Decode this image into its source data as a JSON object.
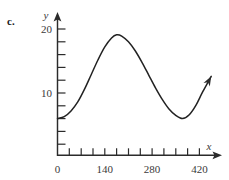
{
  "figure": {
    "part_label": "c.",
    "x_axis_name": "x",
    "y_axis_name": "y"
  },
  "chart_data": {
    "type": "line",
    "title": "",
    "subtitle": "",
    "xlabel": "x",
    "ylabel": "y",
    "xlim": [
      0,
      455
    ],
    "ylim": [
      0,
      21.5
    ],
    "grid": false,
    "legend": null,
    "x_tick_labels": [
      "0",
      "140",
      "280",
      "420"
    ],
    "x_tick_label_values": [
      0,
      140,
      280,
      420
    ],
    "x_minor_tick_values": [
      35,
      70,
      105,
      140,
      175,
      210,
      245,
      280,
      315,
      350,
      385,
      420
    ],
    "x_tick_interval": 35,
    "y_tick_labels": [
      "10",
      "20"
    ],
    "y_tick_label_values": [
      10,
      20
    ],
    "y_minor_tick_values": [
      2,
      4,
      6,
      8,
      10,
      12,
      14,
      16,
      18,
      20
    ],
    "y_tick_interval": 2,
    "series": [
      {
        "name": "sinusoidal-curve",
        "color": "#222222",
        "has_end_arrow": true,
        "annotations": [
          {
            "label": "start",
            "x": 0,
            "y": 6
          },
          {
            "label": "maximum",
            "x": 175,
            "y": 19.1
          },
          {
            "label": "minimum",
            "x": 370,
            "y": 6
          },
          {
            "label": "end",
            "x": 455,
            "y": 12.6
          }
        ],
        "x": [
          0,
          20,
          40,
          60,
          80,
          100,
          120,
          140,
          160,
          175,
          190,
          210,
          230,
          250,
          270,
          290,
          310,
          330,
          350,
          370,
          390,
          410,
          430,
          455
        ],
        "y": [
          6.0,
          6.3,
          7.2,
          8.6,
          10.6,
          12.9,
          15.2,
          17.2,
          18.6,
          19.1,
          18.9,
          18.0,
          16.6,
          14.8,
          12.8,
          10.8,
          9.0,
          7.5,
          6.5,
          6.0,
          6.6,
          8.1,
          10.2,
          12.6
        ]
      }
    ]
  }
}
